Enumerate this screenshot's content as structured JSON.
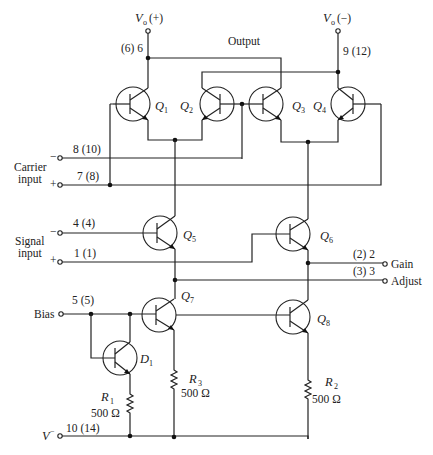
{
  "diagram": {
    "output_label": "Output",
    "vo_plus": {
      "symbol": "V",
      "sub": "o",
      "sign": "(+)",
      "pin": "(6) 6"
    },
    "vo_minus": {
      "symbol": "V",
      "sub": "o",
      "sign": "(−)",
      "pin": "9 (12)"
    },
    "carrier": {
      "label_line1": "Carrier",
      "label_line2": "input",
      "minus_pin": "8 (10)",
      "plus_pin": "7 (8)",
      "minus_sign": "−",
      "plus_sign": "+"
    },
    "signal": {
      "label_line1": "Signal",
      "label_line2": "input",
      "minus_pin": "4 (4)",
      "plus_pin": "1 (1)",
      "minus_sign": "−",
      "plus_sign": "+"
    },
    "gain": {
      "pin": "(2) 2",
      "label": "Gain"
    },
    "adjust": {
      "pin": "(3) 3",
      "label": "Adjust"
    },
    "bias": {
      "pin": "5 (5)",
      "label": "Bias"
    },
    "vminus": {
      "pin": "10 (14)",
      "symbol": "V",
      "sup": "−"
    },
    "transistors": [
      {
        "id": "Q",
        "sub": "1"
      },
      {
        "id": "Q",
        "sub": "2"
      },
      {
        "id": "Q",
        "sub": "3"
      },
      {
        "id": "Q",
        "sub": "4"
      },
      {
        "id": "Q",
        "sub": "5"
      },
      {
        "id": "Q",
        "sub": "6"
      },
      {
        "id": "Q",
        "sub": "7"
      },
      {
        "id": "Q",
        "sub": "8"
      },
      {
        "id": "D",
        "sub": "1"
      }
    ],
    "resistors": [
      {
        "id": "R",
        "sub": "1",
        "value": "500 Ω"
      },
      {
        "id": "R",
        "sub": "2",
        "value": "500 Ω"
      },
      {
        "id": "R",
        "sub": "3",
        "value": "500 Ω"
      }
    ]
  }
}
